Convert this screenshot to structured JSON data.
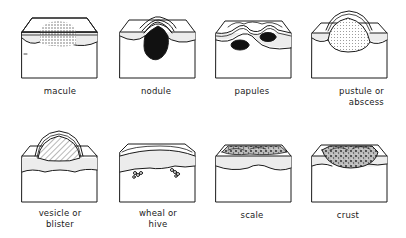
{
  "figure": {
    "rows": [
      {
        "panels": [
          {
            "id": "macule",
            "label_lines": [
              "macule"
            ]
          },
          {
            "id": "nodule",
            "label_lines": [
              "nodule"
            ]
          },
          {
            "id": "papules",
            "label_lines": [
              "papules"
            ]
          },
          {
            "id": "pustule",
            "label_lines": [
              "pustule or",
              "abscess"
            ]
          }
        ]
      },
      {
        "panels": [
          {
            "id": "vesicle",
            "label_lines": [
              "vesicle or",
              "blister"
            ]
          },
          {
            "id": "wheal",
            "label_lines": [
              "wheal or",
              "hive"
            ]
          },
          {
            "id": "scale",
            "label_lines": [
              "scale"
            ]
          },
          {
            "id": "crust",
            "label_lines": [
              "crust"
            ]
          }
        ]
      }
    ]
  },
  "colors": {
    "line": "#1a1a1a",
    "background": "#ffffff",
    "dermis_shade": "#ececec"
  }
}
